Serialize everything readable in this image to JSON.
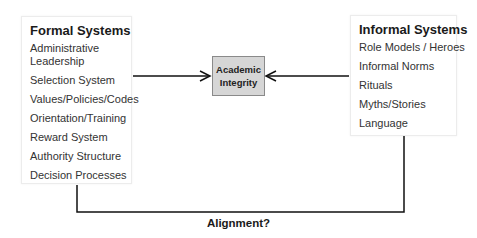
{
  "formal": {
    "title": "Formal Systems",
    "items": [
      "Administrative Leadership",
      "Selection System",
      "Values/Policies/Codes",
      "Orientation/Training",
      "Reward System",
      "Authority Structure",
      "Decision Processes"
    ]
  },
  "informal": {
    "title": "Informal Systems",
    "items": [
      "Role Models / Heroes",
      "Informal Norms",
      "Rituals",
      "Myths/Stories",
      "Language"
    ]
  },
  "center": {
    "line1": "Academic",
    "line2": "Integrity",
    "fill": "#d6d6d6"
  },
  "caption": "Alignment?"
}
